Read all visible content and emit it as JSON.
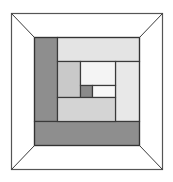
{
  "diagram": {
    "outer_frame": {
      "x1": 11,
      "y1": 13,
      "x2": 162,
      "y2": 169,
      "fill": "#ffffff",
      "stroke": "#555555"
    },
    "inner_square": {
      "x1": 34,
      "y1": 37,
      "x2": 139,
      "y2": 145,
      "stroke": "#333333"
    },
    "blocks": [
      {
        "name": "left-strip-dark",
        "x": 34,
        "y": 37,
        "w": 23,
        "h": 84,
        "fill": "#8e8e8e"
      },
      {
        "name": "top-strip-light",
        "x": 57,
        "y": 37,
        "w": 82,
        "h": 24,
        "fill": "#e4e4e4"
      },
      {
        "name": "right-strip-light",
        "x": 115,
        "y": 61,
        "w": 24,
        "h": 60,
        "fill": "#e8e8e8"
      },
      {
        "name": "bottom-strip-dark",
        "x": 34,
        "y": 121,
        "w": 105,
        "h": 24,
        "fill": "#8e8e8e"
      },
      {
        "name": "left-middle-gray",
        "x": 57,
        "y": 61,
        "w": 23,
        "h": 36,
        "fill": "#c9c9c9"
      },
      {
        "name": "top-center-pale",
        "x": 80,
        "y": 61,
        "w": 35,
        "h": 24,
        "fill": "#f4f4f4"
      },
      {
        "name": "center-dark-square",
        "x": 80,
        "y": 85,
        "w": 12,
        "h": 12,
        "fill": "#8a8a8a"
      },
      {
        "name": "center-white-strip",
        "x": 92,
        "y": 85,
        "w": 23,
        "h": 12,
        "fill": "#f8f8f8"
      },
      {
        "name": "bottom-center-gray",
        "x": 57,
        "y": 97,
        "w": 58,
        "h": 24,
        "fill": "#d4d4d4"
      }
    ],
    "diagonals": [
      {
        "x1": 11,
        "y1": 13,
        "x2": 34,
        "y2": 37
      },
      {
        "x1": 162,
        "y1": 13,
        "x2": 139,
        "y2": 37
      },
      {
        "x1": 11,
        "y1": 169,
        "x2": 34,
        "y2": 145
      },
      {
        "x1": 162,
        "y1": 169,
        "x2": 139,
        "y2": 145
      }
    ],
    "line_color": "#3a3a3a"
  }
}
